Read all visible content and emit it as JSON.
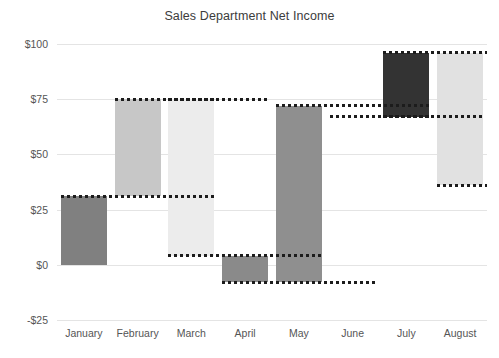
{
  "chart_data": {
    "type": "bar",
    "subtype": "waterfall",
    "title": "Sales Department Net Income",
    "xlabel": "",
    "ylabel": "",
    "categories": [
      "January",
      "February",
      "March",
      "April",
      "May",
      "June",
      "July",
      "August"
    ],
    "cumulative_values": [
      31,
      75,
      4,
      -8,
      72,
      67,
      96,
      36
    ],
    "deltas": [
      31,
      44,
      -71,
      -12,
      80,
      -5,
      29,
      -60
    ],
    "bar_bases": [
      0,
      31,
      4,
      -8,
      -8,
      67,
      67,
      36
    ],
    "bar_tops": [
      31,
      75,
      75,
      4,
      72,
      72,
      96,
      96
    ],
    "values": [
      31,
      75,
      4,
      -8,
      72,
      67,
      96,
      36
    ],
    "ylim": [
      -25,
      100
    ],
    "ytick_labels": [
      "$100",
      "$75",
      "$50",
      "$25",
      "$0",
      "-$25"
    ],
    "ytick_values": [
      100,
      75,
      50,
      25,
      0,
      -25
    ],
    "grid": true,
    "legend": "none",
    "bar_colors": [
      "#808080",
      "#c7c7c7",
      "#ececec",
      "#8a8a8a",
      "#8f8f8f",
      "#ffffff",
      "#333333",
      "#e1e1e1"
    ],
    "connector_color": "#1c1c1c",
    "gridline_color": "#e4e4e4",
    "background": "#ffffff"
  }
}
